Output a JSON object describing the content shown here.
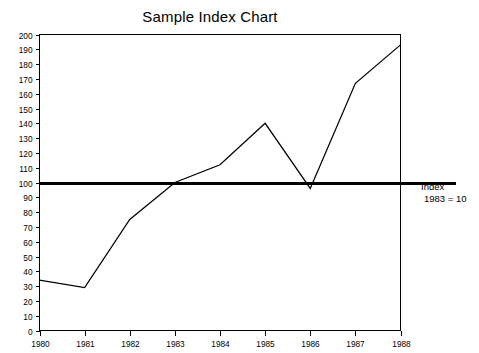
{
  "chart_data": {
    "type": "line",
    "title": "Sample Index Chart",
    "xlabel": "",
    "ylabel": "",
    "categories": [
      "1980",
      "1981",
      "1982",
      "1983",
      "1984",
      "1985",
      "1986",
      "1987",
      "1988"
    ],
    "x": [
      1980,
      1981,
      1982,
      1983,
      1984,
      1985,
      1986,
      1987,
      1988
    ],
    "values": [
      34,
      29,
      75,
      100,
      112,
      140,
      96,
      167,
      193
    ],
    "series": [
      {
        "name": "Index",
        "values": [
          34,
          29,
          75,
          100,
          112,
          140,
          96,
          167,
          193
        ]
      }
    ],
    "ylim": [
      0,
      200
    ],
    "xlim": [
      1980,
      1988
    ],
    "y_ticks": [
      0,
      10,
      20,
      30,
      40,
      50,
      60,
      70,
      80,
      90,
      100,
      110,
      120,
      130,
      140,
      150,
      160,
      170,
      180,
      190,
      200
    ],
    "y_tick_labels": [
      "0",
      "10",
      "20",
      "30",
      "40",
      "50",
      "60",
      "70",
      "80",
      "90",
      "100",
      "110",
      "120",
      "130",
      "140",
      "150",
      "160",
      "170",
      "180",
      "190",
      "200"
    ],
    "x_ticks": [
      1980,
      1981,
      1982,
      1983,
      1984,
      1985,
      1986,
      1987,
      1988
    ],
    "x_tick_labels": [
      "1980",
      "1981",
      "1982",
      "1983",
      "1984",
      "1985",
      "1986",
      "1987",
      "1988"
    ],
    "grid": false,
    "legend_position": "right",
    "reference_line": {
      "value": 100,
      "label_line_1": "Index",
      "label_line_2": "1983 = 10"
    },
    "colors": {
      "line": "#000000",
      "axis": "#000000",
      "reference": "#000000",
      "background": "#ffffff",
      "text": "#000000"
    }
  },
  "annotation": {
    "line1": "Index",
    "line2": "1983 = 10"
  }
}
